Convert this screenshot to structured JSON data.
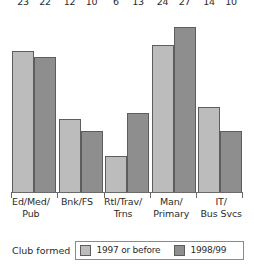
{
  "chart_data": {
    "type": "bar",
    "title": "",
    "subtitle": "",
    "xlabel": "",
    "ylabel": "",
    "ylim": [
      0,
      30
    ],
    "grid": false,
    "legend_position": "bottom",
    "legend_title": "Club formed",
    "categories": [
      "Ed/Med/\nPub",
      "Bnk/FS",
      "Rtl/Trav/\nTrns",
      "Man/\nPrimary",
      "IT/\nBus Svcs"
    ],
    "category_lines": [
      [
        "Ed/Med/",
        "Pub"
      ],
      [
        "Bnk/FS",
        ""
      ],
      [
        "Rtl/Trav/",
        "Trns"
      ],
      [
        "Man/",
        "Primary"
      ],
      [
        "IT/",
        "Bus Svcs"
      ]
    ],
    "series": [
      {
        "name": "1997 or before",
        "color": "#bcbcbc",
        "values": [
          23,
          12,
          6,
          24,
          14
        ]
      },
      {
        "name": "1998/99",
        "color": "#8e8e8e",
        "values": [
          22,
          10,
          13,
          27,
          10
        ]
      }
    ],
    "data_labels": [
      [
        "23",
        "22"
      ],
      [
        "12",
        "10"
      ],
      [
        "6",
        "13"
      ],
      [
        "24",
        "27"
      ],
      [
        "14",
        "10"
      ]
    ]
  },
  "colors": {
    "series_1997_or_before": "#bcbcbc",
    "series_1998_99": "#8e8e8e",
    "bar_outline": "#5d5d5d",
    "axis": "#6a6a6a",
    "text": "#2b2b2b",
    "background": "#ffffff"
  }
}
